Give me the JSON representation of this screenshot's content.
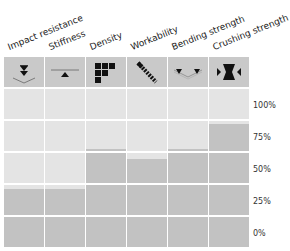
{
  "chart_data": {
    "type": "bar",
    "title": "",
    "xlabel": "",
    "ylabel": "",
    "categories": [
      "Impact resistance",
      "Stiffness",
      "Density",
      "Workability",
      "Bending strength",
      "Crushing strength"
    ],
    "icons": [
      "impact-icon",
      "stiffness-icon",
      "density-icon",
      "workability-icon",
      "bending-icon",
      "crushing-icon"
    ],
    "values": [
      37,
      37,
      62,
      56,
      62,
      78
    ],
    "yticks": [
      "100%",
      "75%",
      "50%",
      "25%",
      "0%"
    ],
    "ylim": [
      0,
      100
    ],
    "grid": true,
    "legend": "none"
  },
  "colors": {
    "icon_bg": "#c9c9c9",
    "cell_bg": "#e4e4e4",
    "fill": "#c2c2c2",
    "grid_line": "#ffffff"
  }
}
